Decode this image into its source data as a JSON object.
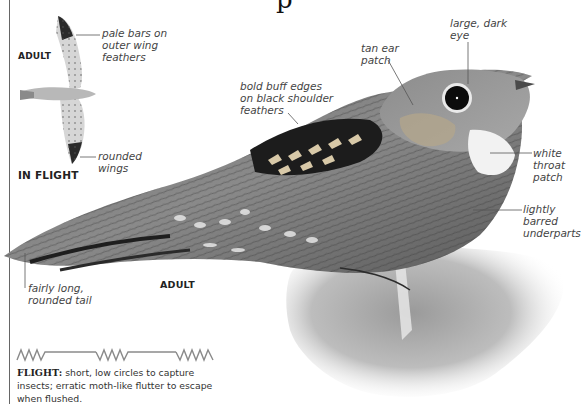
{
  "page": {
    "title_fragment": "p"
  },
  "flight_figure": {
    "label": "ADULT",
    "caption": "IN FLIGHT",
    "annotations": {
      "pale_bars": "pale bars on\nouter wing\nfeathers",
      "rounded_wings": "rounded\nwings"
    }
  },
  "main_figure": {
    "label": "ADULT",
    "annotations": {
      "large_eye": "large, dark\neye",
      "ear_patch": "tan ear\npatch",
      "shoulder": "bold buff edges\non black shoulder\nfeathers",
      "throat": "white\nthroat\npatch",
      "underparts": "lightly\nbarred\nunderparts",
      "tail": "fairly long,\nrounded tail"
    }
  },
  "flight_pattern": {
    "icon": "zigzag-flight-pattern-icon",
    "heading": "FLIGHT:",
    "text": " short, low circles to capture insects; erratic moth-like flutter to escape when flushed."
  },
  "colors": {
    "text": "#222222",
    "annotation": "#444444",
    "leader_line": "#555555",
    "pattern_line": "#8a8a8a",
    "background": "#ffffff"
  }
}
